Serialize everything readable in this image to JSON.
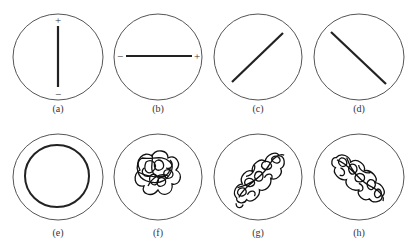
{
  "figure": {
    "panels": [
      {
        "id": "a",
        "label": "(a)",
        "type": "vertical-line",
        "signs": {
          "top": "+",
          "bottom": "−"
        }
      },
      {
        "id": "b",
        "label": "(b)",
        "type": "horizontal-line",
        "signs": {
          "left": "−",
          "right": "+"
        }
      },
      {
        "id": "c",
        "label": "(c)",
        "type": "diagonal-line-rising"
      },
      {
        "id": "d",
        "label": "(d)",
        "type": "diagonal-line-falling"
      },
      {
        "id": "e",
        "label": "(e)",
        "type": "ring"
      },
      {
        "id": "f",
        "label": "(f)",
        "type": "tangled-cluster-round"
      },
      {
        "id": "g",
        "label": "(g)",
        "type": "tangled-cluster-rising"
      },
      {
        "id": "h",
        "label": "(h)",
        "type": "tangled-cluster-falling"
      }
    ]
  }
}
